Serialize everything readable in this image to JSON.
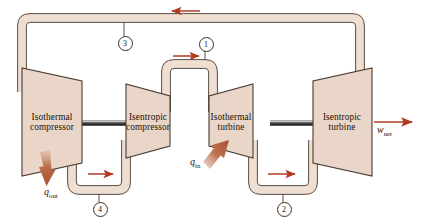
{
  "figure": {
    "type": "thermodynamic-cycle-schematic",
    "name": "Ericsson cycle hardware schematic"
  },
  "devices": [
    {
      "id": "isothermal-compressor",
      "line1": "Isothermal",
      "line2": "compressor",
      "kind": "compressor"
    },
    {
      "id": "isentropic-compressor",
      "line1": "Isentropic",
      "line2": "compressor",
      "kind": "compressor"
    },
    {
      "id": "isothermal-turbine",
      "line1": "Isothermal",
      "line2": "turbine",
      "kind": "turbine"
    },
    {
      "id": "isentropic-turbine",
      "line1": "Isentropic",
      "line2": "turbine",
      "kind": "turbine"
    }
  ],
  "states": [
    {
      "id": "state-1",
      "label": "1"
    },
    {
      "id": "state-2",
      "label": "2"
    },
    {
      "id": "state-3",
      "label": "3"
    },
    {
      "id": "state-4",
      "label": "4"
    }
  ],
  "energy": {
    "q_in": {
      "symbol": "q",
      "subscript": "in",
      "direction": "into-isothermal-turbine"
    },
    "q_out": {
      "symbol": "q",
      "subscript": "out",
      "direction": "out-of-isothermal-compressor"
    },
    "w_net": {
      "symbol": "w",
      "subscript": "net",
      "direction": "out-of-isentropic-turbine"
    }
  },
  "flow_arrows": [
    {
      "id": "arrow-top",
      "direction": "left"
    },
    {
      "id": "arrow-state-1",
      "direction": "right"
    },
    {
      "id": "arrow-bottom-left",
      "direction": "right"
    },
    {
      "id": "arrow-bottom-right",
      "direction": "right"
    }
  ],
  "colors": {
    "device_fill": "#e9d6c9",
    "device_stroke": "#4a3b30",
    "pipe_fill": "#efded2",
    "pipe_stroke": "#4a3b30",
    "arrow_red": "#b03a22",
    "heat_arrow": "#b5613f",
    "shaft_dark": "#2e2e2e",
    "background": "#ffffff"
  }
}
